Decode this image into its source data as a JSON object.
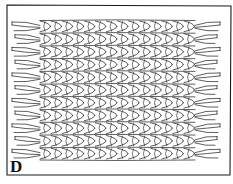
{
  "figure": {
    "label": "D",
    "frame": {
      "x": 7,
      "y": 5,
      "width": 224,
      "height": 170
    },
    "stroke_color": "#1a1a1a",
    "background": "#ffffff",
    "rows": 11,
    "links_per_row": 14,
    "row_top": 20,
    "row_bottom": 160,
    "braid_left": 40,
    "braid_right": 195
  }
}
